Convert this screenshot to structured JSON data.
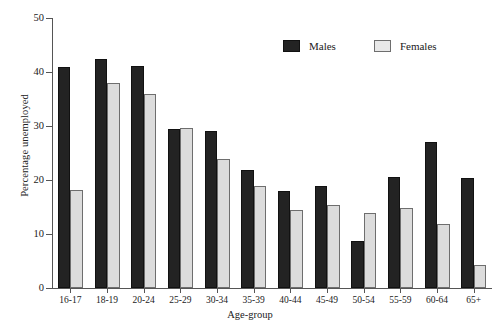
{
  "chart_data": {
    "type": "bar",
    "title": "",
    "xlabel": "Age-group",
    "ylabel": "Percentage unemployed",
    "ylim": [
      0,
      50
    ],
    "yticks": [
      0,
      10,
      20,
      30,
      40,
      50
    ],
    "grid": false,
    "legend_position": "top-right",
    "categories": [
      "16-17",
      "18-19",
      "20-24",
      "25-29",
      "30-34",
      "35-39",
      "40-44",
      "45-49",
      "50-54",
      "55-59",
      "60-64",
      "65+"
    ],
    "series": [
      {
        "name": "Males",
        "color": "#232323",
        "values": [
          41.0,
          42.5,
          41.2,
          29.5,
          29.1,
          21.8,
          18.0,
          18.8,
          8.7,
          20.5,
          27.1,
          20.4
        ]
      },
      {
        "name": "Females",
        "color": "#dcdcdc",
        "values": [
          18.1,
          38.0,
          36.0,
          29.7,
          23.8,
          18.9,
          14.4,
          15.4,
          13.8,
          14.8,
          11.8,
          4.2
        ]
      }
    ]
  },
  "legend": {
    "items": [
      {
        "label": "Males",
        "swatch": "males-swatch"
      },
      {
        "label": "Females",
        "swatch": "females-swatch"
      }
    ]
  }
}
